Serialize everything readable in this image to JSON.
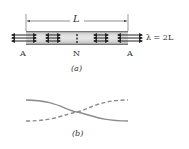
{
  "figure_a": {
    "dimension_label": "L",
    "wavelength_label": "λ = 2L",
    "node_labels": [
      "A",
      "N",
      "A"
    ],
    "caption": "(a)",
    "tube_color": "#b8b8b8",
    "arrow_color": "#222222"
  },
  "figure_b": {
    "caption": "(b)",
    "curves": [
      {
        "name": "solid-curve",
        "style": "solid",
        "color": "#8c8c8c"
      },
      {
        "name": "dashed-curve",
        "style": "dashed",
        "color": "#8c8c8c"
      }
    ]
  }
}
